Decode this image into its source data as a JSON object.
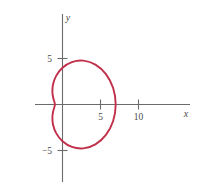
{
  "figure": {
    "title": "",
    "background_color": "#ffffff"
  },
  "chart_data": {
    "type": "line",
    "title": "",
    "subtitle": "",
    "plot_kind": "polar-curve-on-cartesian-axes",
    "curve_name": "dimpled limacon",
    "polar_equation": "r = 4 + 3 cos(theta)",
    "curve_color": "#C0304A",
    "axis_color": "#6b6b6b",
    "xlabel": "x",
    "ylabel": "y",
    "xlim": [
      -3.6,
      17.0
    ],
    "ylim": [
      -9.8,
      10.6
    ],
    "grid": false,
    "legend": null,
    "x_ticks": [
      {
        "value": 5,
        "label": "5"
      },
      {
        "value": 10,
        "label": "10"
      }
    ],
    "y_ticks": [
      {
        "value": 5,
        "label": "5"
      },
      {
        "value": -5,
        "label": "−5"
      }
    ],
    "annotations": [],
    "x_extent_of_curve": [
      -1.0,
      7.0
    ],
    "y_extent_of_curve": [
      -5.2,
      5.2
    ],
    "points_polar": [
      {
        "theta_deg": 0,
        "r": 7.0,
        "x": 7.0,
        "y": 0.0
      },
      {
        "theta_deg": 15,
        "r": 6.898,
        "x": 6.663,
        "y": 1.785
      },
      {
        "theta_deg": 30,
        "r": 6.598,
        "x": 5.714,
        "y": 3.299
      },
      {
        "theta_deg": 45,
        "r": 6.121,
        "x": 4.329,
        "y": 4.329
      },
      {
        "theta_deg": 60,
        "r": 5.5,
        "x": 2.75,
        "y": 4.763
      },
      {
        "theta_deg": 75,
        "r": 4.776,
        "x": 1.236,
        "y": 4.613
      },
      {
        "theta_deg": 90,
        "r": 4.0,
        "x": 0.0,
        "y": 4.0
      },
      {
        "theta_deg": 105,
        "r": 3.224,
        "x": -0.834,
        "y": 3.114
      },
      {
        "theta_deg": 120,
        "r": 2.5,
        "x": -1.25,
        "y": 2.165
      },
      {
        "theta_deg": 135,
        "r": 1.879,
        "x": -1.329,
        "y": 1.329
      },
      {
        "theta_deg": 150,
        "r": 1.402,
        "x": -1.214,
        "y": 0.701
      },
      {
        "theta_deg": 165,
        "r": 1.102,
        "x": -1.064,
        "y": 0.285
      },
      {
        "theta_deg": 180,
        "r": 1.0,
        "x": -1.0,
        "y": 0.0
      },
      {
        "theta_deg": 195,
        "r": 1.102,
        "x": -1.064,
        "y": -0.285
      },
      {
        "theta_deg": 210,
        "r": 1.402,
        "x": -1.214,
        "y": -0.701
      },
      {
        "theta_deg": 225,
        "r": 1.879,
        "x": -1.329,
        "y": -1.329
      },
      {
        "theta_deg": 240,
        "r": 2.5,
        "x": -1.25,
        "y": -2.165
      },
      {
        "theta_deg": 255,
        "r": 3.224,
        "x": -0.834,
        "y": -3.114
      },
      {
        "theta_deg": 270,
        "r": 4.0,
        "x": 0.0,
        "y": -4.0
      },
      {
        "theta_deg": 285,
        "r": 4.776,
        "x": 1.236,
        "y": -4.613
      },
      {
        "theta_deg": 300,
        "r": 5.5,
        "x": 2.75,
        "y": -4.763
      },
      {
        "theta_deg": 315,
        "r": 6.121,
        "x": 4.329,
        "y": -4.329
      },
      {
        "theta_deg": 330,
        "r": 6.598,
        "x": 5.714,
        "y": -3.299
      },
      {
        "theta_deg": 345,
        "r": 6.898,
        "x": 6.663,
        "y": -1.785
      },
      {
        "theta_deg": 360,
        "r": 7.0,
        "x": 7.0,
        "y": 0.0
      }
    ]
  },
  "axes": {
    "x_axis_label": "x",
    "y_axis_label": "y",
    "x_tick_labels": [
      "5",
      "10"
    ],
    "y_tick_labels": [
      "5",
      "−5"
    ]
  }
}
